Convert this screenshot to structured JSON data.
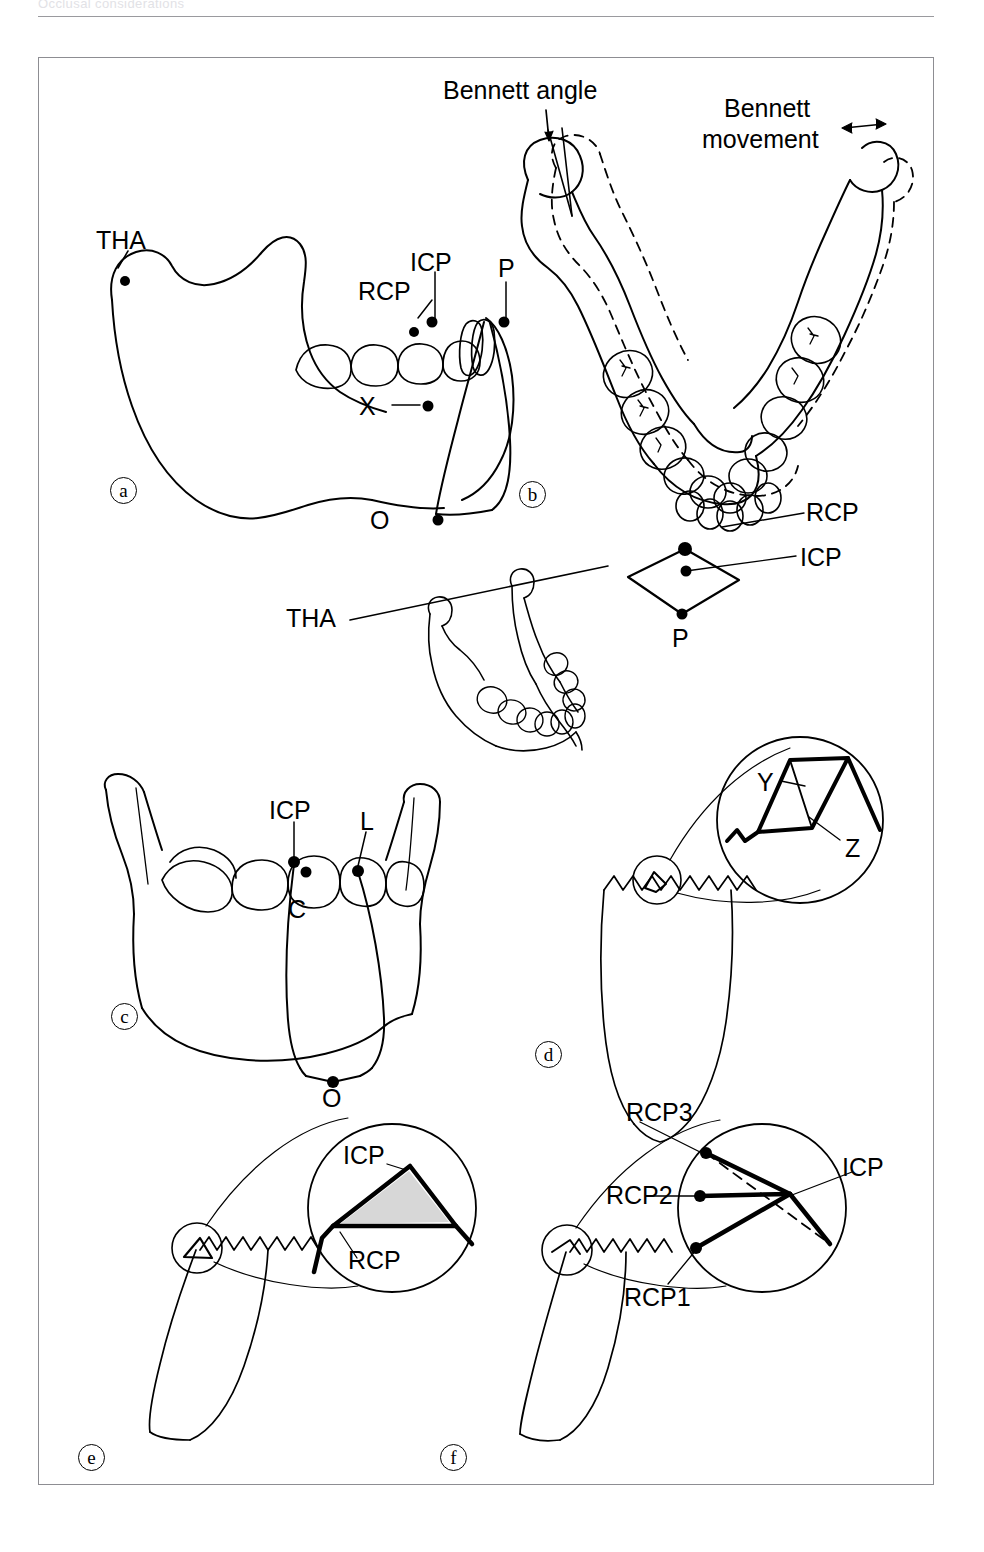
{
  "page": {
    "running_header": "Occlusal considerations",
    "background": "#ffffff",
    "ink": "#000000"
  },
  "figure": {
    "frame": {
      "x": 38,
      "y": 57,
      "width": 896,
      "height": 1428
    },
    "panels": [
      {
        "id": "a",
        "mark": "a",
        "caption_view": "lateral mandible"
      },
      {
        "id": "b",
        "mark": "b",
        "caption_view": "superior occlusal mandible"
      },
      {
        "id": "c",
        "mark": "c",
        "caption_view": "frontal mandible"
      },
      {
        "id": "d",
        "mark": "d",
        "caption_view": "tooth with magnifier"
      },
      {
        "id": "e",
        "mark": "e",
        "caption_view": "tooth with magnifier"
      },
      {
        "id": "f",
        "mark": "f",
        "caption_view": "tooth with magnifier"
      }
    ]
  },
  "labels": {
    "panel_a": {
      "tha": "THA",
      "rcp": "RCP",
      "icp": "ICP",
      "p": "P",
      "x": "X",
      "o": "O"
    },
    "panel_b": {
      "bennett_angle": "Bennett angle",
      "bennett_movement_line1": "Bennett",
      "bennett_movement_line2": "movement",
      "rcp": "RCP",
      "icp": "ICP",
      "p": "P"
    },
    "panel_mid": {
      "tha": "THA"
    },
    "panel_c": {
      "icp": "ICP",
      "l": "L",
      "c": "C",
      "o": "O"
    },
    "panel_d": {
      "y": "Y",
      "z": "Z"
    },
    "panel_e": {
      "icp": "ICP",
      "rcp": "RCP"
    },
    "panel_f": {
      "rcp3": "RCP3",
      "rcp2": "RCP2",
      "rcp1": "RCP1",
      "icp": "ICP"
    }
  },
  "panel_marks": {
    "a": "a",
    "b": "b",
    "c": "c",
    "d": "d",
    "e": "e",
    "f": "f"
  }
}
